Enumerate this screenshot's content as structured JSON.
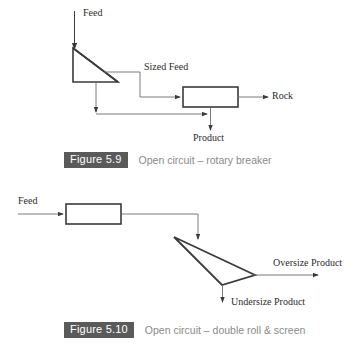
{
  "page": {
    "background": "#ffffff",
    "line_color": "#3a3a3a",
    "badge_color": "#5a5a5a",
    "caption_text_color": "#8a8a8a"
  },
  "figures": [
    {
      "id": "figure-5-9",
      "number": "Figure 5.9",
      "caption": "Open circuit – rotary breaker",
      "labels": {
        "feed": "Feed",
        "sized_feed": "Sized Feed",
        "rock": "Rock",
        "product": "Product"
      }
    },
    {
      "id": "figure-5-10",
      "number": "Figure 5.10",
      "caption": "Open circuit – double roll & screen",
      "labels": {
        "feed": "Feed",
        "oversize_product": "Oversize Product",
        "undersize_product": "Undersize Product"
      }
    }
  ]
}
